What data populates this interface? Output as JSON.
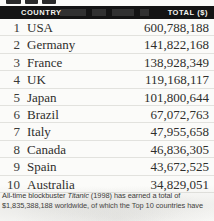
{
  "table": {
    "headers": {
      "rank": "",
      "country": "COUNTRY",
      "total": "TOTAL ($)"
    },
    "rows": [
      {
        "rank": "1",
        "country": "USA",
        "total": "600,788,188"
      },
      {
        "rank": "2",
        "country": "Germany",
        "total": "141,822,168"
      },
      {
        "rank": "3",
        "country": "France",
        "total": "138,928,349"
      },
      {
        "rank": "4",
        "country": "UK",
        "total": "119,168,117"
      },
      {
        "rank": "5",
        "country": "Japan",
        "total": "101,800,644"
      },
      {
        "rank": "6",
        "country": "Brazil",
        "total": "67,072,763"
      },
      {
        "rank": "7",
        "country": "Italy",
        "total": "47,955,658"
      },
      {
        "rank": "8",
        "country": "Canada",
        "total": "46,836,305"
      },
      {
        "rank": "9",
        "country": "Spain",
        "total": "43,672,525"
      },
      {
        "rank": "10",
        "country": "Australia",
        "total": "34,829,051"
      }
    ]
  },
  "caption": {
    "line1_pre": "All-time blockbuster ",
    "line1_title": "Titanic",
    "line1_post": " (1998) has earned a total of",
    "line2": "$1,835,388,188 worldwide, of which the Top 10 countries have"
  },
  "chart_data": {
    "type": "table",
    "title": "",
    "columns": [
      "COUNTRY",
      "TOTAL ($)"
    ],
    "categories": [
      "USA",
      "Germany",
      "France",
      "UK",
      "Japan",
      "Brazil",
      "Italy",
      "Canada",
      "Spain",
      "Australia"
    ],
    "values": [
      600788188,
      141822168,
      138928349,
      119168117,
      101800644,
      67072763,
      47955658,
      46836305,
      43672525,
      34829051
    ],
    "ranks": [
      1,
      2,
      3,
      4,
      5,
      6,
      7,
      8,
      9,
      10
    ],
    "xlabel": "COUNTRY",
    "ylabel": "TOTAL ($)",
    "notes": "All-time blockbuster Titanic (1998) has earned a total of $1,835,388,188 worldwide, of which the Top 10 countries have"
  },
  "colors": {
    "header_bg": "#141414",
    "header_text": "#f4f4f2",
    "page_bg": "#fbfbf9",
    "body_text": "#2e2e2c",
    "rule": "#e2e2de"
  }
}
